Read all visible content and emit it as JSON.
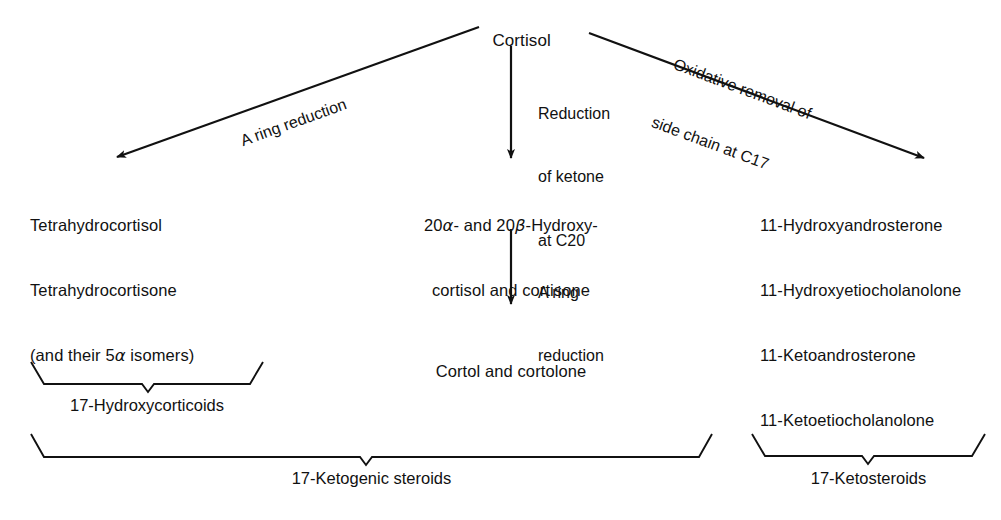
{
  "diagram": {
    "title": "Cortisol",
    "root": {
      "label": "Cortisol"
    },
    "pathways": [
      {
        "id": "a-ring-reduction",
        "label": "A ring reduction",
        "direction": "down-left"
      },
      {
        "id": "reduction-of-ketone",
        "label_line1": "Reduction",
        "label_line2": "of ketone",
        "label_line3": "at C20",
        "direction": "down"
      },
      {
        "id": "oxidative-removal",
        "label_line1": "Oxidative removal of",
        "label_line2": "side chain at C17",
        "direction": "down-right"
      },
      {
        "id": "a-ring-reduction-2",
        "label_line1": "A ring",
        "label_line2": "reduction",
        "direction": "down"
      }
    ],
    "products": {
      "left": {
        "line1": "Tetrahydrocortisol",
        "line2": "Tetrahydrocortisone",
        "line3_pre": "(and their 5",
        "line3_greek": "α",
        "line3_post": " isomers)"
      },
      "center_top": {
        "line1_pre": "20",
        "line1_greek1": "α",
        "line1_mid": "- and 20",
        "line1_greek2": "β",
        "line1_post": "-Hydroxy-",
        "line2": "cortisol and cortisone"
      },
      "center_bottom": {
        "line1": "Cortol and cortolone"
      },
      "right": {
        "line1": "11-Hydroxyandrosterone",
        "line2": "11-Hydroxyetiocholanolone",
        "line3": "11-Ketoandrosterone",
        "line4": "11-Ketoetiocholanolone"
      }
    },
    "groupings": [
      {
        "id": "hydroxycorticoids",
        "label": "17-Hydroxycorticoids"
      },
      {
        "id": "ketogenic-steroids",
        "label": "17-Ketogenic steroids"
      },
      {
        "id": "ketosteroids",
        "label": "17-Ketosteroids"
      }
    ],
    "colors": {
      "ink": "#111111",
      "background": "#ffffff"
    }
  }
}
